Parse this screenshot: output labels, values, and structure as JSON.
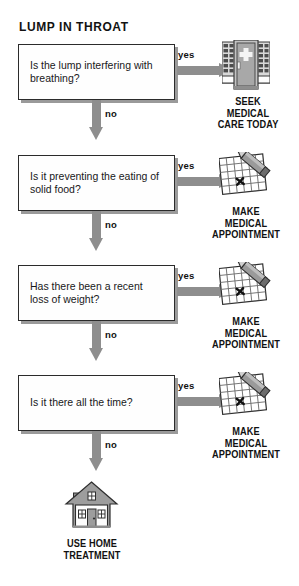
{
  "title": "LUMP IN THROAT",
  "labels": {
    "yes": "yes",
    "no": "no"
  },
  "steps": [
    {
      "question": "Is the lump interfering with breathing?",
      "yes_label": "yes",
      "no_label": "no",
      "outcome": "SEEK\nMEDICAL\nCARE TODAY",
      "outcome_line1": "SEEK",
      "outcome_line2": "MEDICAL",
      "outcome_line3": "CARE TODAY",
      "icon": "hospital-door-icon"
    },
    {
      "question": "Is it preventing the eating of solid food?",
      "yes_label": "yes",
      "no_label": "no",
      "outcome_line1": "MAKE",
      "outcome_line2": "MEDICAL",
      "outcome_line3": "APPOINTMENT",
      "icon": "calendar-pencil-icon"
    },
    {
      "question": "Has there been a recent loss of weight?",
      "yes_label": "yes",
      "no_label": "no",
      "outcome_line1": "MAKE",
      "outcome_line2": "MEDICAL",
      "outcome_line3": "APPOINTMENT",
      "icon": "calendar-pencil-icon"
    },
    {
      "question": "Is it there all the time?",
      "yes_label": "yes",
      "no_label": "no",
      "outcome_line1": "MAKE",
      "outcome_line2": "MEDICAL",
      "outcome_line3": "APPOINTMENT",
      "icon": "calendar-pencil-icon"
    }
  ],
  "final": {
    "outcome_line1": "USE HOME",
    "outcome_line2": "TREATMENT",
    "icon": "house-icon"
  },
  "colors": {
    "arrow_gray": "#8e8e8e",
    "box_border": "#2b2b2b",
    "box_shadow": "#9a9a9a",
    "text": "#18181a",
    "icon_gray": "#8e8e8e",
    "icon_dark": "#4a4a4a"
  }
}
